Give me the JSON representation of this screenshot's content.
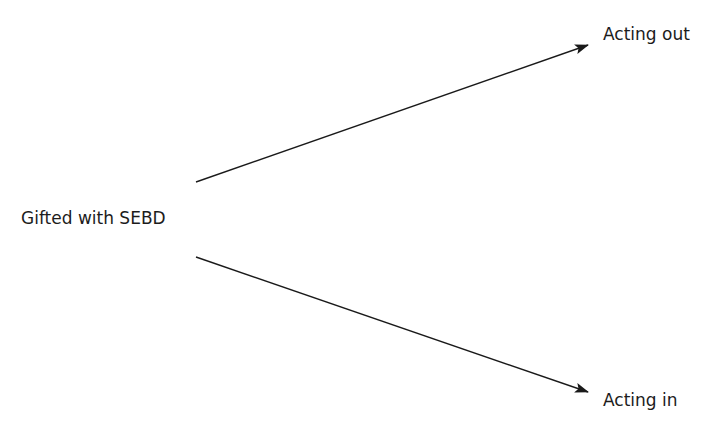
{
  "diagram": {
    "source_node": {
      "label": "Gifted with SEBD"
    },
    "targets": [
      {
        "label": "Acting out"
      },
      {
        "label": "Acting in"
      }
    ],
    "edges": [
      {
        "from": "Gifted with SEBD",
        "to": "Acting out"
      },
      {
        "from": "Gifted with SEBD",
        "to": "Acting in"
      }
    ],
    "colors": {
      "line": "#1a1a1a",
      "text": "#1c1c1c",
      "background": "#ffffff"
    }
  }
}
